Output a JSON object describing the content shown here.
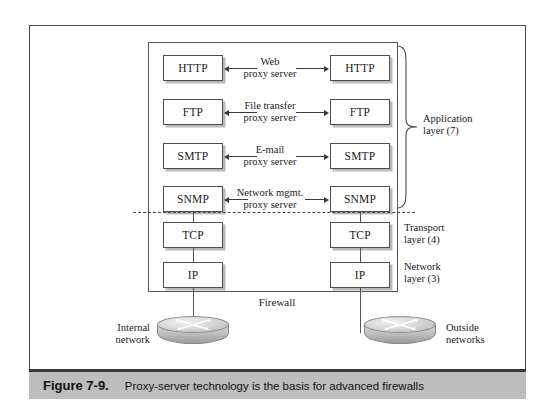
{
  "figure": {
    "number": "Figure 7-9.",
    "caption": "Proxy-server technology is the basis for advanced firewalls"
  },
  "diagram": {
    "firewall_label": "Firewall",
    "rows": [
      {
        "left_box": "HTTP",
        "right_box": "HTTP",
        "proxy_line1": "Web",
        "proxy_line2": "proxy server"
      },
      {
        "left_box": "FTP",
        "right_box": "FTP",
        "proxy_line1": "File transfer",
        "proxy_line2": "proxy server"
      },
      {
        "left_box": "SMTP",
        "right_box": "SMTP",
        "proxy_line1": "E-mail",
        "proxy_line2": "proxy server"
      },
      {
        "left_box": "SNMP",
        "right_box": "SNMP",
        "proxy_line1": "Network mgmt.",
        "proxy_line2": "proxy server"
      }
    ],
    "lower_rows": [
      {
        "left_box": "TCP",
        "right_box": "TCP"
      },
      {
        "left_box": "IP",
        "right_box": "IP"
      }
    ],
    "layers": [
      {
        "line1": "Application",
        "line2": "layer (7)"
      },
      {
        "line1": "Transport",
        "line2": "layer (4)"
      },
      {
        "line1": "Network",
        "line2": "layer (3)"
      }
    ],
    "networks": [
      {
        "line1": "Internal",
        "line2": "network"
      },
      {
        "line1": "Outside",
        "line2": "networks"
      }
    ]
  }
}
